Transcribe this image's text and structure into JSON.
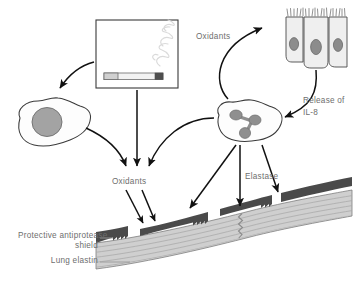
{
  "figure": {
    "background_color": "#ffffff",
    "text_color": "#6e6e6e",
    "stroke_color": "#1a1a1a",
    "shield_color": "#4a4a4a",
    "elastin_color": "#c9c9c9",
    "nucleus_color": "#8f8f8f",
    "cell_fill": "#fbfbfb"
  },
  "labels": {
    "oxidants_upper": "Oxidants",
    "oxidants_lower": "Oxidants",
    "release_of": "Release of",
    "il8": "IL-8",
    "elastase": "Elastase",
    "shield_line1": "Protective antiprotease",
    "shield_line2": "shield",
    "lung_elastin": "Lung elastin"
  },
  "nodes": {
    "cigarette_box": "cigarette-smoke-box",
    "macrophage": "macrophage-cell",
    "neutrophil": "neutrophil-cell",
    "epithelium": "ciliated-epithelial-cells",
    "epithelial_cell_count": 3,
    "neutrophil_nucleus_lobes": 3,
    "shield_segments": 4,
    "elastin_striation_count": 5
  },
  "arrows": [
    {
      "name": "box-to-macrophage",
      "label": ""
    },
    {
      "name": "box-to-oxidants",
      "label": ""
    },
    {
      "name": "macrophage-to-oxidants",
      "label": ""
    },
    {
      "name": "neutrophil-to-oxidants",
      "label": ""
    },
    {
      "name": "neutrophil-to-epithelium",
      "label": "Oxidants"
    },
    {
      "name": "epithelium-to-neutrophil",
      "label": "Release of IL-8"
    },
    {
      "name": "oxidants-to-shield-left",
      "label": ""
    },
    {
      "name": "oxidants-to-shield-right",
      "label": ""
    },
    {
      "name": "neutrophil-to-shield-left",
      "label": ""
    },
    {
      "name": "neutrophil-to-elastin",
      "label": "Elastase"
    },
    {
      "name": "neutrophil-to-shield-right",
      "label": ""
    }
  ]
}
